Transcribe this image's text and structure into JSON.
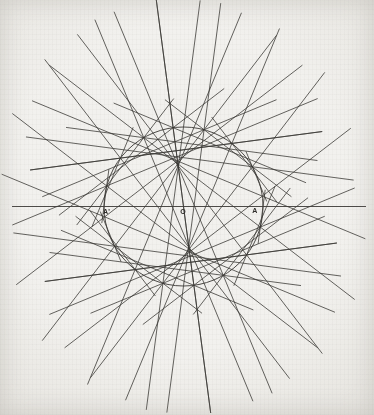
{
  "figure": {
    "kind": "geometric-construction",
    "canvas": {
      "width": 374,
      "height": 415
    },
    "background_color": "#f2f1ee",
    "ink_color": "#3a3834",
    "circle": {
      "name": "base-circle",
      "center_x": 183.5,
      "center_y": 206.5,
      "radius": 79.5,
      "stroke_width": 0.9
    },
    "diameter": {
      "name": "diameter-AA-prime",
      "x1": 12,
      "y1": 206.5,
      "x2": 366,
      "y2": 206.5,
      "stroke_width": 0.9
    },
    "labels": [
      {
        "id": "A-prime",
        "text": "A'",
        "x": 103,
        "y": 208,
        "anchor": "left"
      },
      {
        "id": "O",
        "text": "O",
        "x": 183,
        "y": 208,
        "anchor": "center"
      },
      {
        "id": "A",
        "text": "A",
        "x": 255,
        "y": 207,
        "anchor": "center"
      }
    ],
    "tangent_family": {
      "name": "tangent-envelope-lines",
      "description": "Chords joining point k to point 3k on a circle of N equally spaced points, extended well past the circle so their envelope forms a four-pointed star.",
      "count": 48,
      "step_multiplier": 3,
      "angle_offset_deg": 7.5,
      "extension_factor": 2.62,
      "stroke_width": 0.85,
      "opacity": 0.92
    }
  },
  "chart_data": {
    "type": "scatter",
    "xlabel": "",
    "ylabel": "",
    "xlim": [
      -2.35,
      2.35
    ],
    "ylim": [
      -2.6,
      2.6
    ],
    "grid": false,
    "legend": null,
    "annotations": [
      "A'",
      "O",
      "A"
    ],
    "series": [
      {
        "name": "base-circle",
        "kind": "circle",
        "center": [
          0,
          0
        ],
        "radius": 1
      },
      {
        "name": "diameter",
        "kind": "segment",
        "x": [
          -2.16,
          2.29
        ],
        "y": [
          0,
          0
        ]
      },
      {
        "name": "tangent-chords",
        "kind": "lines",
        "count": 48,
        "step": 3,
        "offset_deg": 7.5
      }
    ]
  }
}
